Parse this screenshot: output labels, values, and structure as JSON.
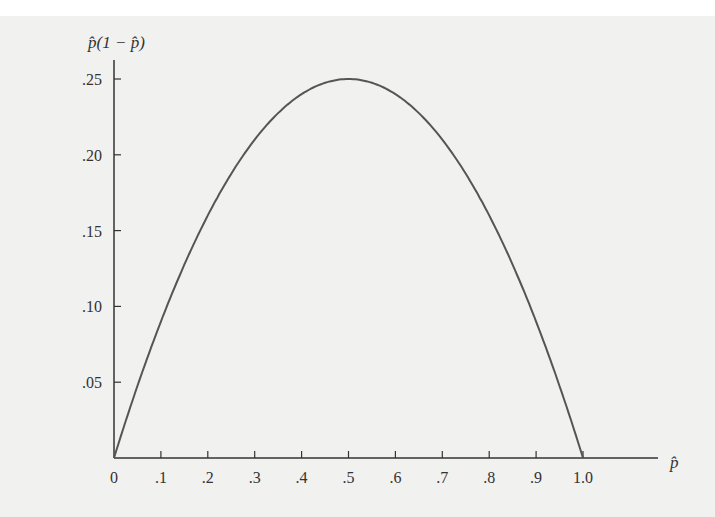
{
  "chart_data": {
    "type": "line",
    "title": "",
    "xlabel": "p̂",
    "ylabel": "p̂(1 − p̂)",
    "xlim": [
      0,
      1.0
    ],
    "ylim": [
      0,
      0.25
    ],
    "grid": false,
    "legend": null,
    "x_ticks": [
      "0",
      ".1",
      ".2",
      ".3",
      ".4",
      ".5",
      ".6",
      ".7",
      ".8",
      ".9",
      "1.0"
    ],
    "y_ticks": [
      ".05",
      ".10",
      ".15",
      ".20",
      ".25"
    ],
    "series": [
      {
        "name": "p̂(1 − p̂)",
        "x": [
          0,
          0.05,
          0.1,
          0.15,
          0.2,
          0.25,
          0.3,
          0.35,
          0.4,
          0.45,
          0.5,
          0.55,
          0.6,
          0.65,
          0.7,
          0.75,
          0.8,
          0.85,
          0.9,
          0.95,
          1.0
        ],
        "values": [
          0,
          0.0475,
          0.09,
          0.1275,
          0.16,
          0.1875,
          0.21,
          0.2275,
          0.24,
          0.2475,
          0.25,
          0.2475,
          0.24,
          0.2275,
          0.21,
          0.1875,
          0.16,
          0.1275,
          0.09,
          0.0475,
          0
        ]
      }
    ],
    "colors": {
      "curve": "#555555",
      "axis": "#333333",
      "background": "#f1f1f0"
    }
  }
}
